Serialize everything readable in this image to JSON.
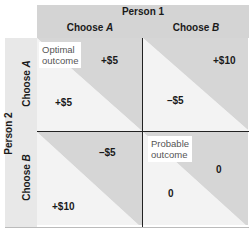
{
  "header": {
    "column_player": "Person 1",
    "columns": [
      {
        "prefix": "Choose ",
        "choice": "A"
      },
      {
        "prefix": "Choose ",
        "choice": "B"
      }
    ],
    "row_player": "Person 2",
    "rows": [
      {
        "prefix": "Choose ",
        "choice": "A"
      },
      {
        "prefix": "Choose ",
        "choice": "B"
      }
    ]
  },
  "cells": {
    "aa": {
      "person1": "+$5",
      "person2": "+$5",
      "note_line1": "Optimal",
      "note_line2": "outcome"
    },
    "ab": {
      "person1": "+$10",
      "person2": "–$5"
    },
    "ba": {
      "person1": "–$5",
      "person2": "+$10"
    },
    "bb": {
      "person1": "0",
      "person2": "0",
      "note_line1": "Probable",
      "note_line2": "outcome"
    }
  },
  "colors": {
    "upper_triangle": "#d6d6d6",
    "lower_triangle": "#f3f3f3",
    "header_band": "#d4d4d4",
    "side_band": "#e8e8e8",
    "divider": "#222222"
  }
}
